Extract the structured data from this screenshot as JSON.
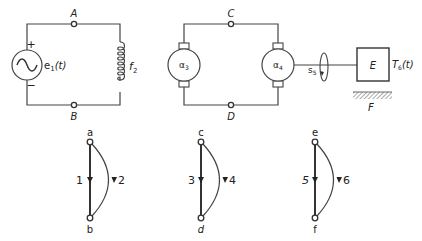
{
  "circuit1": {
    "terminal_top": "A",
    "terminal_bottom": "B",
    "source_label": "e",
    "source_subscript": "1",
    "source_arg": "(t)",
    "plus_sign": "+",
    "minus_sign": "−",
    "inductor_label": "f",
    "inductor_subscript": "2"
  },
  "circuit2": {
    "terminal_top": "C",
    "terminal_bottom": "D",
    "motor_left_label": "α",
    "motor_left_subscript": "3",
    "motor_right_label": "α",
    "motor_right_subscript": "4",
    "shaft_label": "s",
    "shaft_subscript": "5",
    "load_label": "E",
    "torque_label": "T",
    "torque_subscript": "6",
    "torque_arg": "(t)",
    "ground_label": "F"
  },
  "graphs": [
    {
      "top_node": "a",
      "bottom_node": "b",
      "straight_edge": "1",
      "curved_edge": "2"
    },
    {
      "top_node": "c",
      "bottom_node": "d",
      "straight_edge": "3",
      "curved_edge": "4"
    },
    {
      "top_node": "e",
      "bottom_node": "f",
      "straight_edge": "5",
      "curved_edge": "6"
    }
  ]
}
